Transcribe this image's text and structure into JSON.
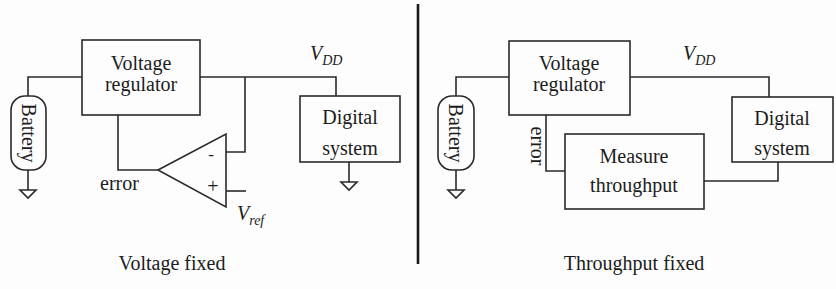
{
  "panels": {
    "left": {
      "caption": "Voltage fixed",
      "regulator": {
        "line1": "Voltage",
        "line2": "regulator"
      },
      "battery": "Battery",
      "digital": {
        "line1": "Digital",
        "line2": "system"
      },
      "vdd": {
        "main": "V",
        "sub": "DD"
      },
      "error": "error",
      "opamp": {
        "minus": "-",
        "plus": "+"
      },
      "vref": {
        "main": "V",
        "sub": "ref"
      }
    },
    "right": {
      "caption": "Throughput fixed",
      "regulator": {
        "line1": "Voltage",
        "line2": "regulator"
      },
      "battery": "Battery",
      "digital": {
        "line1": "Digital",
        "line2": "system"
      },
      "vdd": {
        "main": "V",
        "sub": "DD"
      },
      "error": "error",
      "measure": {
        "line1": "Measure",
        "line2": "throughput"
      }
    }
  }
}
